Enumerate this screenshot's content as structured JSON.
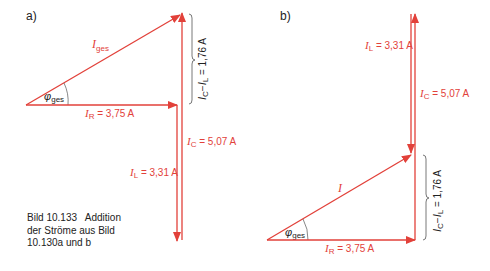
{
  "diagram": {
    "colors": {
      "vector": "#e2413a",
      "bracket": "#555555",
      "text": "#222222"
    },
    "panel_a": {
      "label": "a)",
      "I_ges_label": "I",
      "I_ges_sub": "ges",
      "phi_label": "φ",
      "phi_sub": "ges",
      "I_R_sym": "I",
      "I_R_sub": "R",
      "I_R_val": " = 3,75 A",
      "I_C_sym": "I",
      "I_C_sub": "C",
      "I_C_val": " = 5,07 A",
      "I_L_sym": "I",
      "I_L_sub": "L",
      "I_L_val": " = 3,31 A",
      "diff_label_a": "I",
      "diff_sub_a": "C",
      "diff_minus": "−",
      "diff_label_b": "I",
      "diff_sub_b": "L",
      "diff_val": " = 1,76 A"
    },
    "panel_b": {
      "label": "b)",
      "I_label": "I",
      "phi_label": "φ",
      "phi_sub": "ges",
      "I_R_sym": "I",
      "I_R_sub": "R",
      "I_R_val": " = 3,75 A",
      "I_C_sym": "I",
      "I_C_sub": "C",
      "I_C_val": " = 5,07 A",
      "I_L_sym": "I",
      "I_L_sub": "L",
      "I_L_val": " = 3,31 A",
      "diff_label_a": "I",
      "diff_sub_a": "C",
      "diff_minus": "−",
      "diff_label_b": "I",
      "diff_sub_b": "L",
      "diff_val": " = 1,76 A"
    },
    "caption": {
      "line1": "Bild 10.133   Addition",
      "line2": "der Ströme aus Bild",
      "line3": "10.130a und b"
    }
  }
}
